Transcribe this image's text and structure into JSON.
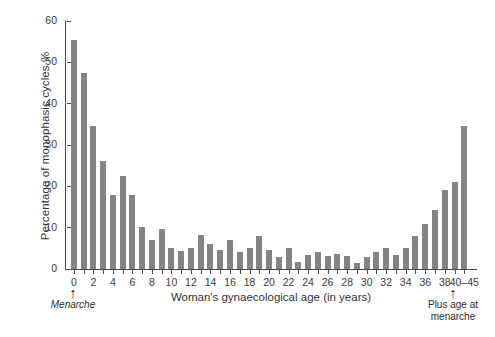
{
  "chart_data": {
    "type": "bar",
    "title": "",
    "xlabel": "Woman's gynaecological age (in years)",
    "ylabel": "Percentage of monophasic cycles %",
    "xlim": [
      -0.8,
      41.2
    ],
    "ylim": [
      0,
      60
    ],
    "yticks": [
      0,
      10,
      20,
      30,
      40,
      50,
      60
    ],
    "ytick_labels": [
      "0",
      "10",
      "20",
      "30",
      "40",
      "50",
      "60"
    ],
    "xticks": [
      0,
      1,
      2,
      3,
      4,
      5,
      6,
      7,
      8,
      9,
      10,
      11,
      12,
      13,
      14,
      15,
      16,
      17,
      18,
      19,
      20,
      21,
      22,
      23,
      24,
      25,
      26,
      27,
      28,
      29,
      30,
      31,
      32,
      33,
      34,
      35,
      36,
      37,
      38,
      39,
      40
    ],
    "xtick_labels_shown": [
      "0",
      "2",
      "4",
      "6",
      "8",
      "10",
      "12",
      "14",
      "16",
      "18",
      "20",
      "22",
      "24",
      "26",
      "28",
      "30",
      "32",
      "34",
      "36",
      "38",
      "40–45"
    ],
    "grid": false,
    "legend": false,
    "bar_color": "#848484",
    "axis_color": "#4a4a4a",
    "categories": [
      "0",
      "1",
      "2",
      "3",
      "4",
      "5",
      "6",
      "7",
      "8",
      "9",
      "10",
      "11",
      "12",
      "13",
      "14",
      "15",
      "16",
      "17",
      "18",
      "19",
      "20",
      "21",
      "22",
      "23",
      "24",
      "25",
      "26",
      "27",
      "28",
      "29",
      "30",
      "31",
      "32",
      "33",
      "34",
      "35",
      "36",
      "37",
      "38",
      "39",
      "40–45"
    ],
    "values": [
      55.5,
      47.4,
      34.7,
      26.1,
      18.0,
      22.4,
      18.0,
      10.2,
      7.0,
      9.7,
      5.0,
      4.3,
      5.2,
      8.2,
      6.0,
      4.7,
      7.0,
      4.1,
      5.0,
      8.0,
      4.5,
      2.9,
      5.2,
      1.8,
      3.5,
      4.0,
      3.1,
      3.7,
      3.2,
      1.5,
      2.8,
      4.2,
      5.0,
      3.4,
      5.1,
      8.0,
      11.0,
      14.2,
      19.0,
      21.0,
      34.7
    ]
  },
  "annotations": {
    "left": {
      "arrow": "↑",
      "text": "Menarche"
    },
    "right": {
      "arrow": "↑",
      "line1": "Plus age at",
      "line2": "menarche"
    }
  }
}
